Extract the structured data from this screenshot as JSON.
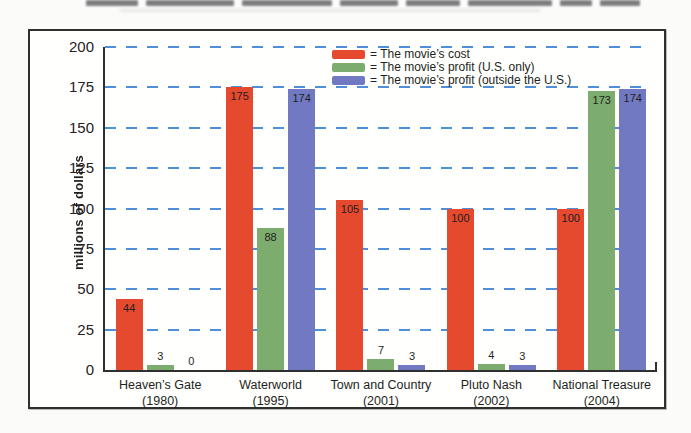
{
  "chart_data": {
    "type": "bar",
    "title": "",
    "ylabel": "millions of dollars",
    "ylim": [
      0,
      200
    ],
    "yticks": [
      200,
      175,
      150,
      125,
      100,
      75,
      50,
      25,
      0
    ],
    "grid": "horizontal-dashed",
    "legend_position": "top-center-inside",
    "categories": [
      {
        "name": "Heaven’s Gate",
        "year": "(1980)"
      },
      {
        "name": "Waterworld",
        "year": "(1995)"
      },
      {
        "name": "Town and Country",
        "year": "(2001)"
      },
      {
        "name": "Pluto Nash",
        "year": "(2002)"
      },
      {
        "name": "National Treasure",
        "year": "(2004)"
      }
    ],
    "series": [
      {
        "name": "The movie’s cost",
        "legend_label": "= The movie’s cost",
        "color": "#e5492e",
        "values": [
          44,
          175,
          105,
          100,
          100
        ]
      },
      {
        "name": "The movie’s profit (U.S. only)",
        "legend_label": "= The movie’s profit (U.S. only)",
        "color": "#7dad6e",
        "values": [
          3,
          88,
          7,
          4,
          173
        ]
      },
      {
        "name": "The movie’s profit (outside the U.S.)",
        "legend_label": "= The movie’s profit (outside the U.S.)",
        "color": "#7179c2",
        "values": [
          0,
          174,
          3,
          3,
          174
        ]
      }
    ],
    "colors": {
      "gridline": "#4f8fd9",
      "axis": "#2f2f2f",
      "frame_border": "#2f2f2f",
      "value_label": "#1f1f1f"
    }
  }
}
